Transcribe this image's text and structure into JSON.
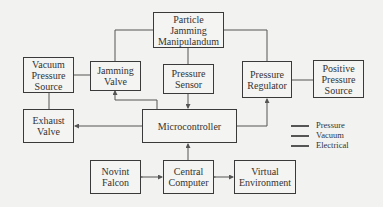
{
  "diagram": {
    "nodes": {
      "particle": {
        "label": "Particle\nJamming\nManipulandum"
      },
      "vacuum": {
        "label": "Vacuum\nPressure\nSource"
      },
      "jamming_valve": {
        "label": "Jamming\nValve"
      },
      "pressure_sensor": {
        "label": "Pressure\nSensor"
      },
      "pressure_regulator": {
        "label": "Pressure\nRegulator"
      },
      "positive": {
        "label": "Positive\nPressure\nSource"
      },
      "exhaust": {
        "label": "Exhaust\nValve"
      },
      "micro": {
        "label": "Microcontroller"
      },
      "falcon": {
        "label": "Novint\nFalcon"
      },
      "central": {
        "label": "Central\nComputer"
      },
      "virtual": {
        "label": "Virtual\nEnvironment"
      }
    },
    "legend": [
      {
        "label": "Pressure"
      },
      {
        "label": "Vacuum"
      },
      {
        "label": "Electrical"
      }
    ],
    "line_color": "#555555"
  }
}
